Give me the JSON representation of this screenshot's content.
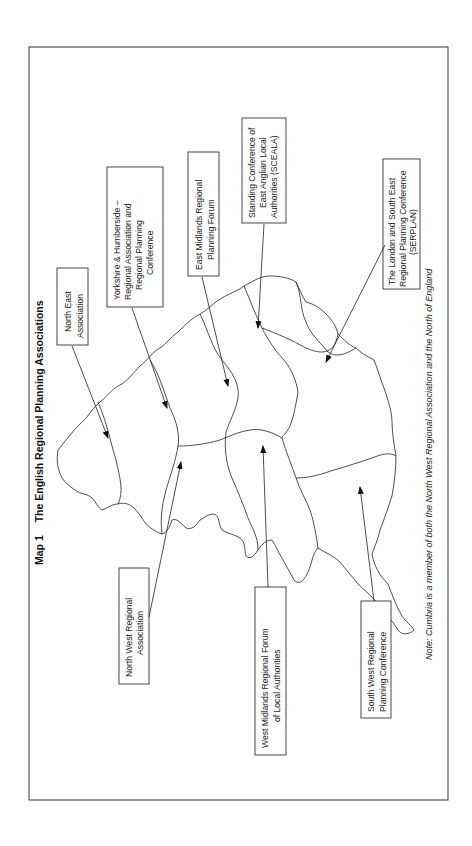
{
  "figure": {
    "map_number": "Map 1",
    "title": "The English Regional Planning Associations",
    "note": "Note: Cumbria is a member of both the North West Regional Association and the North of England"
  },
  "regions": [
    {
      "id": "north-east",
      "lines": [
        "North East",
        "Association"
      ]
    },
    {
      "id": "yorkshire-humberside",
      "lines": [
        "Yorkshire & Humberside –",
        "Regional Association and",
        "Regional Planning",
        "Conference"
      ]
    },
    {
      "id": "east-midlands",
      "lines": [
        "East Midlands Regional",
        "Planning Forum"
      ]
    },
    {
      "id": "east-anglia",
      "lines": [
        "Standing Conference of",
        "East Anglian Local",
        "Authorities (SCEALA)"
      ]
    },
    {
      "id": "london-south-east",
      "lines": [
        "The London and South East",
        "Regional Planning Conference",
        "(SERPLAN)"
      ]
    },
    {
      "id": "north-west",
      "lines": [
        "North West Regional",
        "Association"
      ]
    },
    {
      "id": "west-midlands",
      "lines": [
        "West Midlands Regional Forum",
        "of Local Authorities"
      ]
    },
    {
      "id": "south-west",
      "lines": [
        "South West Regional",
        "Planning Conference"
      ]
    }
  ],
  "colors": {
    "line": "#222222",
    "background": "#ffffff"
  }
}
